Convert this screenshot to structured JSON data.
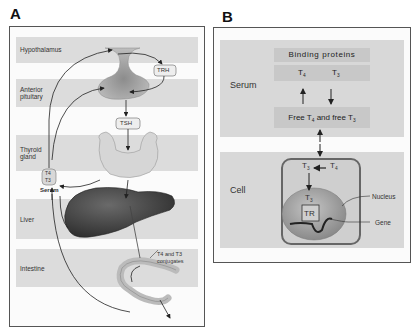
{
  "panel_a": {
    "letter": "A",
    "bands": [
      {
        "label": "Hypothalamus"
      },
      {
        "label": "Anterior pituitary"
      },
      {
        "label": "Thyroid gland"
      },
      {
        "label": "Liver"
      },
      {
        "label": "Intestine"
      }
    ],
    "trh_label": "TRH",
    "tsh_label": "TSH",
    "serum_tag": {
      "line1": "T4",
      "line2": "T3"
    },
    "serum_label": "Serum",
    "conjugates_label_line1": "T4 and T3",
    "conjugates_label_line2": "conjugates"
  },
  "panel_b": {
    "letter": "B",
    "serum_label": "Serum",
    "binding_proteins_label": "Binding proteins",
    "bound_t4": "T",
    "bound_t4_sub": "4",
    "bound_t3": "T",
    "bound_t3_sub": "3",
    "free_label_part1": "Free T",
    "free_label_sub1": "4",
    "free_label_part2": " and free T",
    "free_label_sub2": "3",
    "cell_label": "Cell",
    "cell_t3": "T",
    "cell_t3_sub": "3",
    "cell_t4": "T",
    "cell_t4_sub": "4",
    "nuclear_t3": "T",
    "nuclear_t3_sub": "3",
    "tr_label": "TR",
    "nucleus_label": "Nucleus",
    "gene_label": "Gene"
  },
  "colors": {
    "band_gray": "#dcdcdc",
    "box_gray": "#c8c8c8",
    "panel_bg": "#fbfbfb",
    "liver": "#4a4a4a",
    "nucleus": "#9a9a9a",
    "thyroid": "#cfcfcf"
  }
}
